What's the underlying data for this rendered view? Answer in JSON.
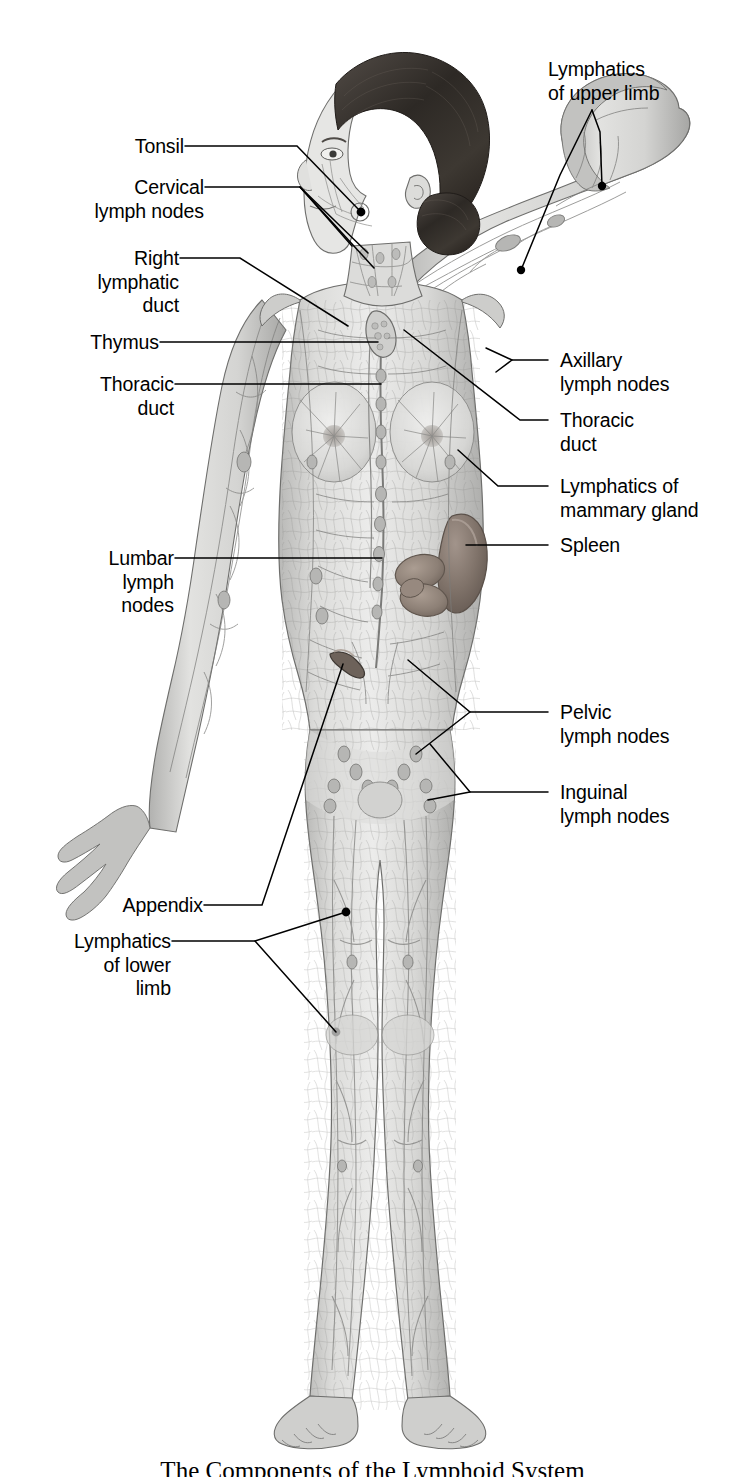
{
  "figure": {
    "title": "The Components of the Lymphoid System",
    "caption": "The Components of the Lymphoid System",
    "colors": {
      "background": "#ffffff",
      "leader_line": "#000000",
      "label_text": "#000000",
      "body_light": "#e3e3e1",
      "body_mid": "#c6c6c4",
      "body_shadow": "#9b9b99",
      "vessel": "#7d7d7b",
      "hair_dark": "#2e2a27",
      "spleen": "#8a7d76",
      "organ_brown": "#9c8d83"
    }
  },
  "labels": {
    "left": [
      {
        "id": "tonsil",
        "text": "Tonsil"
      },
      {
        "id": "cervical-lymph-nodes",
        "text": "Cervical\nlymph nodes"
      },
      {
        "id": "right-lymphatic-duct",
        "text": "Right\nlymphatic\nduct"
      },
      {
        "id": "thymus",
        "text": "Thymus"
      },
      {
        "id": "thoracic-duct",
        "text": "Thoracic\nduct"
      },
      {
        "id": "lumbar-lymph-nodes",
        "text": "Lumbar\nlymph\nnodes"
      },
      {
        "id": "appendix",
        "text": "Appendix"
      },
      {
        "id": "lymphatics-of-lower-limb",
        "text": "Lymphatics\nof lower\nlimb"
      }
    ],
    "right": [
      {
        "id": "lymphatics-of-upper-limb",
        "text": "Lymphatics\nof upper limb"
      },
      {
        "id": "axillary-lymph-nodes",
        "text": "Axillary\nlymph nodes"
      },
      {
        "id": "thoracic-duct-right",
        "text": "Thoracic\nduct"
      },
      {
        "id": "lymphatics-of-mammary-gland",
        "text": "Lymphatics of\nmammary gland"
      },
      {
        "id": "spleen",
        "text": "Spleen"
      },
      {
        "id": "pelvic-lymph-nodes",
        "text": "Pelvic\nlymph nodes"
      },
      {
        "id": "inguinal-lymph-nodes",
        "text": "Inguinal\nlymph nodes"
      }
    ]
  }
}
